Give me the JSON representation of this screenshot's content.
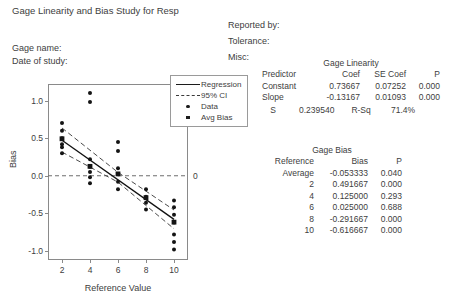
{
  "title": "Gage Linearity and Bias Study for Resp",
  "header": {
    "left": [
      {
        "label": "Gage name:"
      },
      {
        "label": "Date of study:"
      }
    ],
    "right": [
      {
        "label": "Reported by:"
      },
      {
        "label": "Tolerance:"
      },
      {
        "label": "Misc:"
      }
    ]
  },
  "legend": {
    "items": [
      {
        "label": "Regression",
        "key": "solid-line"
      },
      {
        "label": "95% CI",
        "key": "dashed-line"
      },
      {
        "label": "Data",
        "key": "dot-marker"
      },
      {
        "label": "Avg Bias",
        "key": "square-marker"
      }
    ]
  },
  "linearity_table": {
    "caption": "Gage Linearity",
    "columns": [
      "Predictor",
      "Coef",
      "SE Coef",
      "P"
    ],
    "rows": [
      {
        "predictor": "Constant",
        "coef": "0.73667",
        "se_coef": "0.07252",
        "p": "0.000"
      },
      {
        "predictor": "Slope",
        "coef": "-0.13167",
        "se_coef": "0.01093",
        "p": "0.000"
      }
    ],
    "s_label": "S",
    "s_value": "0.239540",
    "rsq_label": "R-Sq",
    "rsq_value": "71.4%"
  },
  "bias_table": {
    "caption": "Gage Bias",
    "columns": [
      "Reference",
      "Bias",
      "P"
    ],
    "rows": [
      {
        "reference": "Average",
        "bias": "-0.053333",
        "p": "0.040"
      },
      {
        "reference": "2",
        "bias": "0.491667",
        "p": "0.000"
      },
      {
        "reference": "4",
        "bias": "0.125000",
        "p": "0.293"
      },
      {
        "reference": "6",
        "bias": "0.025000",
        "p": "0.688"
      },
      {
        "reference": "8",
        "bias": "-0.291667",
        "p": "0.000"
      },
      {
        "reference": "10",
        "bias": "-0.616667",
        "p": "0.000"
      }
    ]
  },
  "chart_data": {
    "type": "scatter",
    "title": "",
    "xlabel": "Reference Value",
    "ylabel": "Bias",
    "xlim": [
      1.0,
      11.0
    ],
    "ylim": [
      -1.12,
      1.22
    ],
    "xticks": [
      2,
      4,
      6,
      8,
      10
    ],
    "yticks": [
      -1.0,
      -0.5,
      0.0,
      0.5,
      1.0
    ],
    "ytick_labels": [
      "-1.0",
      "-0.5",
      "0.0",
      "0.5",
      "1.0"
    ],
    "grid": false,
    "zero_line": {
      "value": 0,
      "style": "dashed",
      "label": "0"
    },
    "regression": {
      "intercept": 0.73667,
      "slope": -0.13167,
      "x_start": 2,
      "x_end": 10,
      "y_start": 0.47333,
      "y_end": -0.58003
    },
    "confidence_interval": {
      "level": "95%",
      "style": "dashed",
      "upper": [
        {
          "x": 2,
          "y": 0.635
        },
        {
          "x": 6,
          "y": 0.045
        },
        {
          "x": 10,
          "y": -0.455
        }
      ],
      "lower": [
        {
          "x": 2,
          "y": 0.315
        },
        {
          "x": 6,
          "y": -0.085
        },
        {
          "x": 10,
          "y": -0.705
        }
      ]
    },
    "series": [
      {
        "name": "Data",
        "marker": "dot",
        "points": [
          {
            "x": 2,
            "y": 0.7
          },
          {
            "x": 2,
            "y": 0.6
          },
          {
            "x": 2,
            "y": 0.5
          },
          {
            "x": 2,
            "y": 0.42
          },
          {
            "x": 2,
            "y": 0.38
          },
          {
            "x": 2,
            "y": 0.3
          },
          {
            "x": 4,
            "y": 1.1
          },
          {
            "x": 4,
            "y": 0.98
          },
          {
            "x": 4,
            "y": 0.22
          },
          {
            "x": 4,
            "y": 0.12
          },
          {
            "x": 4,
            "y": 0.05
          },
          {
            "x": 4,
            "y": -0.02
          },
          {
            "x": 4,
            "y": -0.1
          },
          {
            "x": 6,
            "y": 0.45
          },
          {
            "x": 6,
            "y": 0.33
          },
          {
            "x": 6,
            "y": 0.1
          },
          {
            "x": 6,
            "y": 0.02
          },
          {
            "x": 6,
            "y": -0.08
          },
          {
            "x": 6,
            "y": -0.18
          },
          {
            "x": 8,
            "y": -0.18
          },
          {
            "x": 8,
            "y": -0.28
          },
          {
            "x": 8,
            "y": -0.36
          },
          {
            "x": 8,
            "y": -0.45
          },
          {
            "x": 10,
            "y": -0.33
          },
          {
            "x": 10,
            "y": -0.42
          },
          {
            "x": 10,
            "y": -0.52
          },
          {
            "x": 10,
            "y": -0.62
          },
          {
            "x": 10,
            "y": -0.78
          },
          {
            "x": 10,
            "y": -0.88
          },
          {
            "x": 10,
            "y": -0.98
          }
        ]
      },
      {
        "name": "Avg Bias",
        "marker": "square",
        "points": [
          {
            "x": 2,
            "y": 0.491667
          },
          {
            "x": 4,
            "y": 0.125
          },
          {
            "x": 6,
            "y": 0.025
          },
          {
            "x": 8,
            "y": -0.291667
          },
          {
            "x": 10,
            "y": -0.616667
          }
        ]
      }
    ]
  }
}
